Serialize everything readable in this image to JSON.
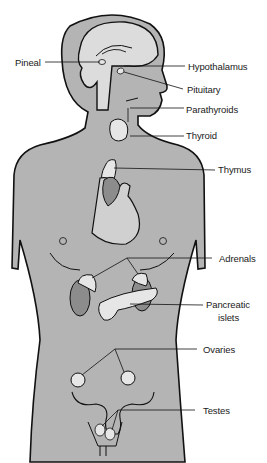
{
  "diagram": {
    "colors": {
      "body_fill": "#b4b4b4",
      "brain_fill": "#dcdcdc",
      "gland_fill": "#e6e6e6",
      "organ_dark": "#8c8c8c",
      "outline": "#111111",
      "background": "#ffffff"
    },
    "labels": {
      "pineal": "Pineal",
      "hypothalamus": "Hypothalamus",
      "pituitary": "Pituitary",
      "parathyroids": "Parathyroids",
      "thyroid": "Thyroid",
      "thymus": "Thymus",
      "adrenals": "Adrenals",
      "pancreatic_islets_line1": "Pancreatic",
      "pancreatic_islets_line2": "islets",
      "ovaries": "Ovaries",
      "testes": "Testes"
    }
  }
}
